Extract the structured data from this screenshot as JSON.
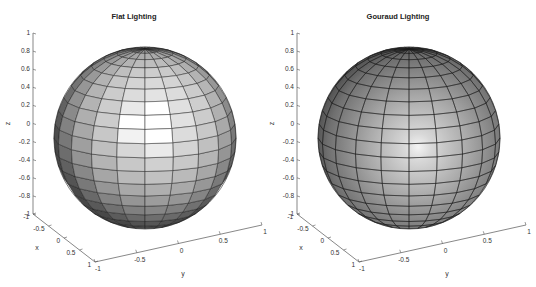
{
  "figure": {
    "background": "#ffffff",
    "axis_color": "#555555",
    "edge_color": "#1a1a1a"
  },
  "chart_data": [
    {
      "type": "surface",
      "title": "Flat Lighting",
      "lighting": "flat",
      "object": "unit sphere (20x20 faces)",
      "xlabel": "x",
      "ylabel": "y",
      "zlabel": "z",
      "xlim": [
        -1,
        1
      ],
      "ylim": [
        -1,
        1
      ],
      "zlim": [
        -1,
        1
      ],
      "xticks": [
        "-1",
        "-0.5",
        "0",
        "0.5",
        "1"
      ],
      "yticks": [
        "-1",
        "-0.5",
        "0",
        "0.5",
        "1"
      ],
      "zticks": [
        "-1",
        "-0.8",
        "-0.6",
        "-0.4",
        "-0.2",
        "0",
        "0.2",
        "0.4",
        "0.6",
        "0.8",
        "1"
      ],
      "colormap": "gray",
      "grid": false
    },
    {
      "type": "surface",
      "title": "Gouraud Lighting",
      "lighting": "gouraud",
      "object": "unit sphere (20x20 faces)",
      "xlabel": "x",
      "ylabel": "y",
      "zlabel": "z",
      "xlim": [
        -1,
        1
      ],
      "ylim": [
        -1,
        1
      ],
      "zlim": [
        -1,
        1
      ],
      "xticks": [
        "-1",
        "-0.5",
        "0",
        "0.5",
        "1"
      ],
      "yticks": [
        "-1",
        "-0.5",
        "0",
        "0.5",
        "1"
      ],
      "zticks": [
        "-1",
        "-0.8",
        "-0.6",
        "-0.4",
        "-0.2",
        "0",
        "0.2",
        "0.4",
        "0.6",
        "0.8",
        "1"
      ],
      "colormap": "gray",
      "grid": false
    }
  ]
}
